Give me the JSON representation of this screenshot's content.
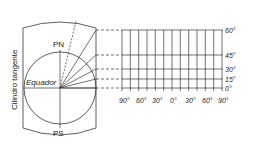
{
  "labels": {
    "north_pole": "PN",
    "south_pole": "PS",
    "equator": "Equador",
    "cylinder": "Cilindro tangente"
  },
  "latitude_labels": [
    "60°",
    "45°",
    "30°",
    "15°",
    "0°"
  ],
  "longitude_labels": [
    "90°",
    "60°",
    "30°",
    "0°",
    "30°",
    "60°",
    "90°"
  ],
  "colors": {
    "line": "#333333",
    "text": "#222222",
    "background": "#ffffff"
  }
}
